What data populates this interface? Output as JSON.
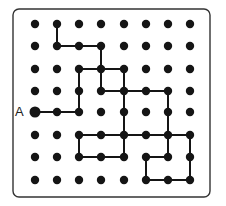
{
  "puzzle": {
    "label": "A",
    "grid": {
      "cols": 8,
      "rows": 8,
      "col_x": [
        35,
        57,
        79,
        101,
        124,
        146,
        168,
        190
      ],
      "row_y": [
        24,
        46,
        69,
        91,
        112,
        135,
        157,
        180
      ],
      "dot_radius": 4.2
    },
    "start_point": {
      "col": 0,
      "row": 4,
      "radius": 5.5
    },
    "label_position": {
      "x": 15,
      "y": 105
    },
    "frame": {
      "x": 13,
      "y": 9,
      "width": 197,
      "height": 188,
      "radius": 6
    },
    "colors": {
      "dot": "#151515",
      "line": "#151515",
      "frame": "#333333",
      "background": "#ffffff"
    },
    "edges": [
      [
        [
          1,
          0
        ],
        [
          1,
          1
        ]
      ],
      [
        [
          1,
          1
        ],
        [
          2,
          1
        ]
      ],
      [
        [
          2,
          1
        ],
        [
          3,
          1
        ]
      ],
      [
        [
          3,
          1
        ],
        [
          3,
          2
        ]
      ],
      [
        [
          2,
          2
        ],
        [
          3,
          2
        ]
      ],
      [
        [
          3,
          2
        ],
        [
          4,
          2
        ]
      ],
      [
        [
          2,
          2
        ],
        [
          2,
          3
        ]
      ],
      [
        [
          2,
          3
        ],
        [
          2,
          4
        ]
      ],
      [
        [
          3,
          2
        ],
        [
          3,
          3
        ]
      ],
      [
        [
          4,
          2
        ],
        [
          4,
          3
        ]
      ],
      [
        [
          3,
          3
        ],
        [
          4,
          3
        ]
      ],
      [
        [
          4,
          3
        ],
        [
          5,
          3
        ]
      ],
      [
        [
          5,
          3
        ],
        [
          6,
          3
        ]
      ],
      [
        [
          4,
          3
        ],
        [
          4,
          4
        ]
      ],
      [
        [
          6,
          3
        ],
        [
          6,
          4
        ]
      ],
      [
        [
          0,
          4
        ],
        [
          1,
          4
        ]
      ],
      [
        [
          1,
          4
        ],
        [
          2,
          4
        ]
      ],
      [
        [
          4,
          4
        ],
        [
          4,
          5
        ]
      ],
      [
        [
          6,
          4
        ],
        [
          6,
          5
        ]
      ],
      [
        [
          2,
          5
        ],
        [
          3,
          5
        ]
      ],
      [
        [
          3,
          5
        ],
        [
          4,
          5
        ]
      ],
      [
        [
          4,
          5
        ],
        [
          5,
          5
        ]
      ],
      [
        [
          5,
          5
        ],
        [
          6,
          5
        ]
      ],
      [
        [
          6,
          5
        ],
        [
          7,
          5
        ]
      ],
      [
        [
          2,
          5
        ],
        [
          2,
          6
        ]
      ],
      [
        [
          4,
          5
        ],
        [
          4,
          6
        ]
      ],
      [
        [
          6,
          5
        ],
        [
          6,
          6
        ]
      ],
      [
        [
          7,
          5
        ],
        [
          7,
          6
        ]
      ],
      [
        [
          2,
          6
        ],
        [
          3,
          6
        ]
      ],
      [
        [
          3,
          6
        ],
        [
          4,
          6
        ]
      ],
      [
        [
          5,
          6
        ],
        [
          6,
          6
        ]
      ],
      [
        [
          5,
          6
        ],
        [
          5,
          7
        ]
      ],
      [
        [
          7,
          6
        ],
        [
          7,
          7
        ]
      ],
      [
        [
          5,
          7
        ],
        [
          6,
          7
        ]
      ],
      [
        [
          6,
          7
        ],
        [
          7,
          7
        ]
      ]
    ]
  }
}
